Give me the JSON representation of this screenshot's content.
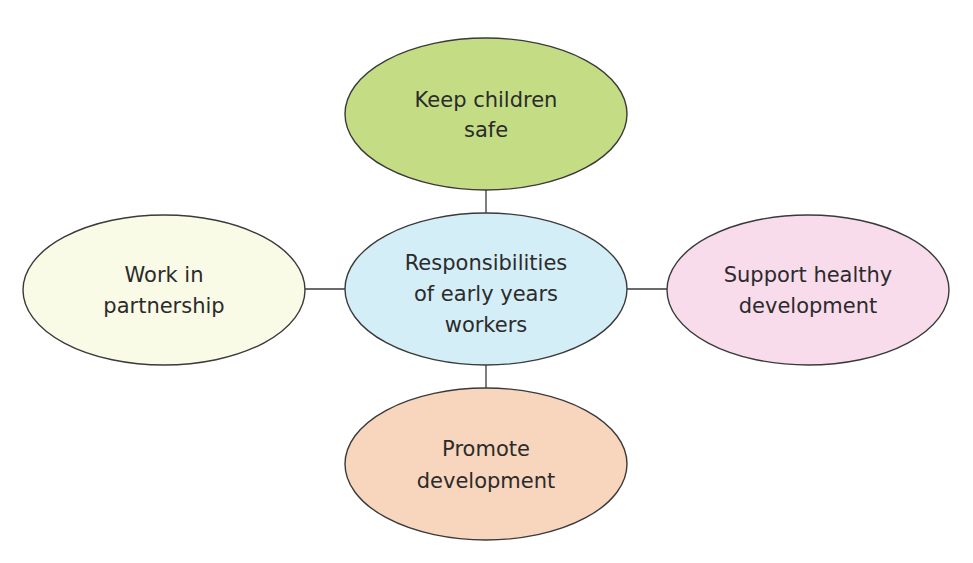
{
  "diagram": {
    "type": "mind-map",
    "center": {
      "lines": [
        "Responsibilities",
        "of early years",
        "workers"
      ],
      "color": "#d4eef8"
    },
    "nodes": [
      {
        "id": "top",
        "lines": [
          "Keep children",
          "safe"
        ],
        "color": "#c4dd85"
      },
      {
        "id": "left",
        "lines": [
          "Work in",
          "partnership"
        ],
        "color": "#fafbe6"
      },
      {
        "id": "right",
        "lines": [
          "Support healthy",
          "development"
        ],
        "color": "#f8dcec"
      },
      {
        "id": "bottom",
        "lines": [
          "Promote",
          "development"
        ],
        "color": "#f7d6bd"
      }
    ],
    "stroke_color": "#3a3a3a"
  }
}
